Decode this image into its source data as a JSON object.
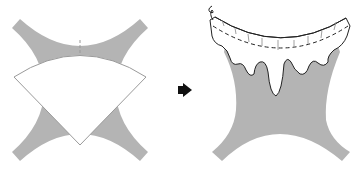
{
  "diagram": {
    "steps": [
      {
        "id": "step-1",
        "label": "Collar piece positioned on fabric"
      },
      {
        "id": "step-2",
        "label": "Collar attached with decorative wavy edge and stitching"
      }
    ],
    "arrow": {
      "label": "next step",
      "direction": "right"
    },
    "colors": {
      "fabric": "#b4b4b4",
      "collar": "#ffffff",
      "outline": "#222222",
      "light_outline": "#9a9a9a",
      "arrow": "#111111"
    }
  }
}
